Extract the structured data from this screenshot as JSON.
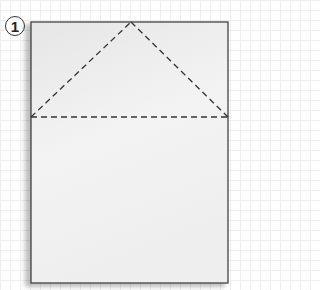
{
  "step": {
    "number": "1"
  },
  "diagram": {
    "paper": {
      "x": 31,
      "y": 22,
      "width": 197,
      "height": 261,
      "fill_top": "#e9e9e9",
      "fill_bottom": "#f6f6f6",
      "border": "#444444"
    },
    "fold_lines": [
      {
        "type": "dashed",
        "from": [
          31,
          117
        ],
        "to": [
          131,
          22
        ]
      },
      {
        "type": "dashed",
        "from": [
          131,
          22
        ],
        "to": [
          228,
          117
        ]
      },
      {
        "type": "dashed",
        "from": [
          31,
          117
        ],
        "to": [
          228,
          117
        ]
      }
    ]
  }
}
